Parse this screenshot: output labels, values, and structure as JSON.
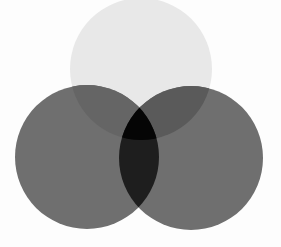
{
  "diagram": {
    "type": "venn",
    "sets": 3,
    "background": "#fdfdfd",
    "circles": [
      {
        "name": "top",
        "cx": 141,
        "cy": 69,
        "r": 71,
        "color": "#e8e8e8"
      },
      {
        "name": "left",
        "cx": 87,
        "cy": 157,
        "r": 72,
        "color": "#6f6f6f"
      },
      {
        "name": "right",
        "cx": 191,
        "cy": 158,
        "r": 72,
        "color": "#6f6f6f"
      }
    ],
    "overlap_colors": {
      "top_right": "#5a5a5a",
      "top_left": "#5e5e5e",
      "left_right": "#1e1e1e",
      "all_three": "#050505"
    }
  }
}
